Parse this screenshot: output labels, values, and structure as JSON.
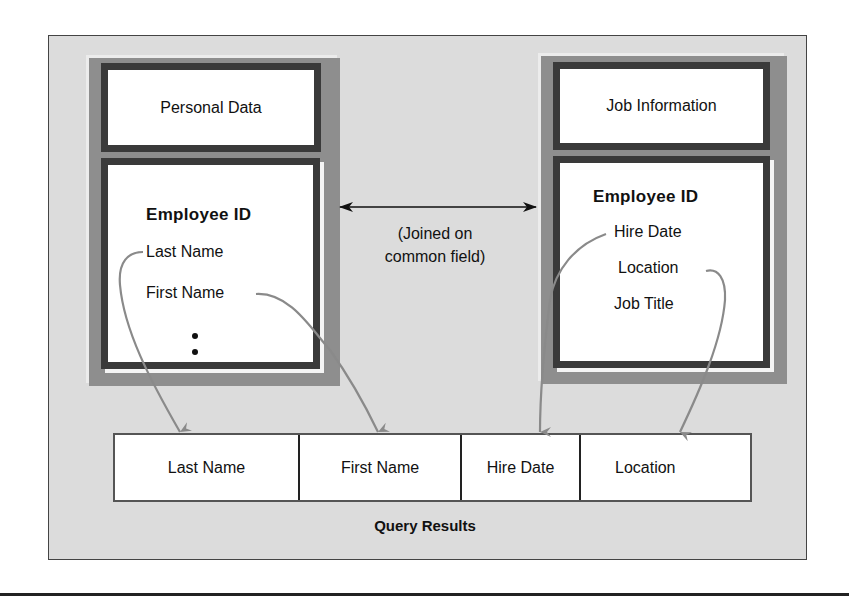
{
  "diagram": {
    "left_table": {
      "title": "Personal Data",
      "key_field": "Employee ID",
      "fields": [
        "Last Name",
        "First Name"
      ],
      "more_indicator": "ellipsis-vertical"
    },
    "right_table": {
      "title": "Job Information",
      "key_field": "Employee ID",
      "fields": [
        "Hire Date",
        "Location",
        "Job Title"
      ]
    },
    "join": {
      "line1": "(Joined on",
      "line2": "common field)",
      "arrow": "double-headed-arrow"
    },
    "query_results": {
      "columns": [
        "Last Name",
        "First Name",
        "Hire Date",
        "Location"
      ],
      "label": "Query Results"
    },
    "colors": {
      "frame_background": "#dcdcdc",
      "panel_gray": "#8e8e8e",
      "box_border": "#3a3a3a",
      "connector_gray": "#8a8a8a"
    }
  }
}
